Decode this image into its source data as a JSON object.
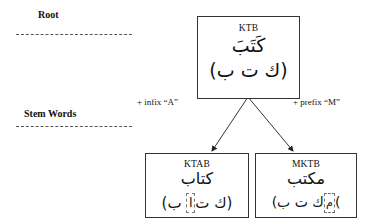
{
  "levels": {
    "root_label": "Root",
    "stem_label": "Stem Words"
  },
  "root_node": {
    "latin": "KTB",
    "arabic_word": "كَتَبَ",
    "arabic_letters": "(ك ت ب)"
  },
  "operations": {
    "left": "+ infix “A”",
    "right": "+ prefix “M”"
  },
  "stem_nodes": [
    {
      "latin": "KTAB",
      "arabic_word": "كتاب",
      "letters_open": "(ك ت",
      "letters_marked": "ا",
      "letters_close": " ب)"
    },
    {
      "latin": "MKTB",
      "arabic_word": "مكتب",
      "letters_open": "(",
      "letters_marked": "م",
      "letters_close": "ك ت ب)"
    }
  ],
  "colors": {
    "line": "#333333",
    "dash": "#555555",
    "background": "#ffffff"
  }
}
